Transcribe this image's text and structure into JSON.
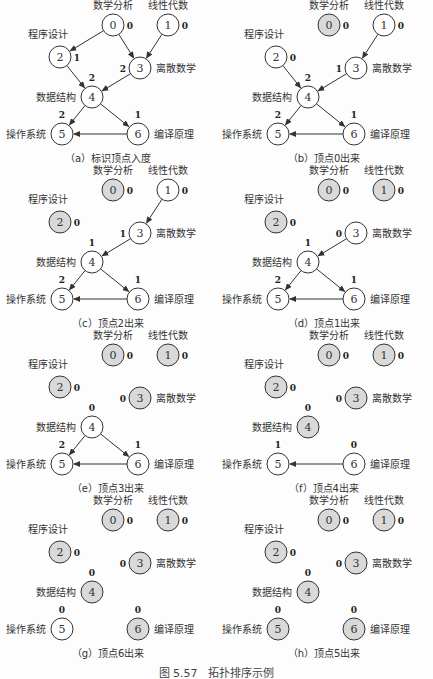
{
  "figure_caption": "图 5.57　拓扑排序示例",
  "course_labels": {
    "0": "数学分析",
    "1": "线性代数",
    "2": "程序设计",
    "3": "离散数学",
    "4": "数据结构",
    "5": "操作系统",
    "6": "编译原理"
  },
  "edges": [
    [
      0,
      2
    ],
    [
      0,
      3
    ],
    [
      1,
      3
    ],
    [
      2,
      4
    ],
    [
      3,
      4
    ],
    [
      4,
      5
    ],
    [
      4,
      6
    ],
    [
      6,
      5
    ]
  ],
  "panels": [
    {
      "id": "a",
      "caption": "（a）标识顶点入度",
      "removed": [],
      "indegree": [
        "0",
        "0",
        "1",
        "2",
        "2",
        "2",
        "1"
      ],
      "edges": [
        [
          0,
          2
        ],
        [
          0,
          3
        ],
        [
          1,
          3
        ],
        [
          2,
          4
        ],
        [
          3,
          4
        ],
        [
          4,
          5
        ],
        [
          4,
          6
        ],
        [
          6,
          5
        ]
      ]
    },
    {
      "id": "b",
      "caption": "（b）顶点0出来",
      "removed": [
        0
      ],
      "indegree": [
        "0",
        "0",
        "0",
        "1",
        "2",
        "2",
        "1"
      ],
      "edges": [
        [
          1,
          3
        ],
        [
          2,
          4
        ],
        [
          3,
          4
        ],
        [
          4,
          5
        ],
        [
          4,
          6
        ],
        [
          6,
          5
        ]
      ]
    },
    {
      "id": "c",
      "caption": "（c）顶点2出来",
      "removed": [
        0,
        2
      ],
      "indegree": [
        "0",
        "0",
        "0",
        "1",
        "1",
        "2",
        "1"
      ],
      "edges": [
        [
          1,
          3
        ],
        [
          3,
          4
        ],
        [
          4,
          5
        ],
        [
          4,
          6
        ],
        [
          6,
          5
        ]
      ]
    },
    {
      "id": "d",
      "caption": "（d）顶点1出来",
      "removed": [
        0,
        1,
        2
      ],
      "indegree": [
        "0",
        "0",
        "0",
        "0",
        "1",
        "2",
        "1"
      ],
      "edges": [
        [
          3,
          4
        ],
        [
          4,
          5
        ],
        [
          4,
          6
        ],
        [
          6,
          5
        ]
      ]
    },
    {
      "id": "e",
      "caption": "（e）顶点3出来",
      "removed": [
        0,
        1,
        2,
        3
      ],
      "indegree": [
        "0",
        "0",
        "0",
        "0",
        "0",
        "2",
        "1"
      ],
      "edges": [
        [
          4,
          5
        ],
        [
          4,
          6
        ],
        [
          6,
          5
        ]
      ]
    },
    {
      "id": "f",
      "caption": "（f）顶点4出来",
      "removed": [
        0,
        1,
        2,
        3,
        4
      ],
      "indegree": [
        "0",
        "0",
        "0",
        "0",
        "0",
        "1",
        "0"
      ],
      "edges": [
        [
          6,
          5
        ]
      ]
    },
    {
      "id": "g",
      "caption": "（g）顶点6出来",
      "removed": [
        0,
        1,
        2,
        3,
        4,
        6
      ],
      "indegree": [
        "0",
        "0",
        "0",
        "0",
        "0",
        "0",
        "0"
      ],
      "edges": []
    },
    {
      "id": "h",
      "caption": "（h）顶点5出来",
      "removed": [
        0,
        1,
        2,
        3,
        4,
        5,
        6
      ],
      "indegree": [
        "0",
        "0",
        "0",
        "0",
        "0",
        "0",
        "0"
      ],
      "edges": []
    }
  ],
  "colors": {
    "removed_fill": "#d9d9d9",
    "node_fill": "#ffffff",
    "stroke": "#333333"
  }
}
